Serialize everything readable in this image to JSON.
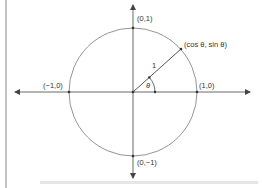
{
  "diagram": {
    "colors": {
      "line": "#444444",
      "circle": "#777777",
      "text": "#333333",
      "border": "#999999",
      "footer_band": "#e6e6e6"
    },
    "geometry": {
      "origin": [
        133,
        92
      ],
      "radius": 64,
      "angle_deg": 42
    },
    "points": {
      "top": "(0,1)",
      "bottom": "(0,−1)",
      "left": "(−1,0)",
      "right": "(1,0)",
      "on_circle": "(cos θ, sin θ)"
    },
    "radius_label": "1",
    "angle_label": "θ"
  }
}
